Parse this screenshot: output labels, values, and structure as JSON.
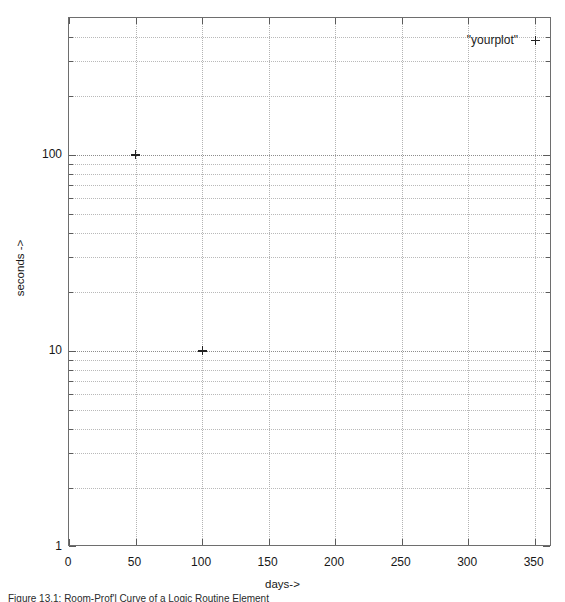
{
  "chart_data": {
    "type": "scatter",
    "title": "",
    "xlabel": "days->",
    "ylabel": "seconds ->",
    "xscale": "linear",
    "yscale": "log",
    "xlim": [
      0,
      363
    ],
    "ylim": [
      1,
      500
    ],
    "grid": true,
    "legend_position": "top-right",
    "series": [
      {
        "name": "\"yourplot\"",
        "marker": "+",
        "color": "#232323",
        "points": [
          {
            "x": 50,
            "y": 100
          },
          {
            "x": 100,
            "y": 10
          }
        ]
      }
    ],
    "xticks": [
      {
        "value": 0,
        "label": "0"
      },
      {
        "value": 50,
        "label": "50"
      },
      {
        "value": 100,
        "label": "100"
      },
      {
        "value": 150,
        "label": "150"
      },
      {
        "value": 200,
        "label": "200"
      },
      {
        "value": 250,
        "label": "250"
      },
      {
        "value": 300,
        "label": "300"
      },
      {
        "value": 350,
        "label": "350"
      }
    ],
    "yticks": [
      {
        "value": 1,
        "label": "1"
      },
      {
        "value": 10,
        "label": "10"
      },
      {
        "value": 100,
        "label": "100"
      }
    ],
    "yminorticks": [
      2,
      3,
      4,
      5,
      6,
      7,
      8,
      9,
      20,
      30,
      40,
      50,
      60,
      70,
      80,
      90,
      200,
      300,
      400,
      500
    ],
    "colors": {
      "frame": "#6e6e6e",
      "grid_major": "#8d8d8d",
      "grid_minor": "#b9b9b9",
      "text": "#171717",
      "background": "#ffffff"
    }
  },
  "legend": {
    "entry_label": "\"yourplot\"",
    "marker_glyph": "+"
  },
  "axes": {
    "x_title": "days->",
    "y_title": "seconds ->"
  },
  "caption": {
    "text": "Figure 13.1: Room-Prof'l Curve of a Logic Routine Element"
  }
}
